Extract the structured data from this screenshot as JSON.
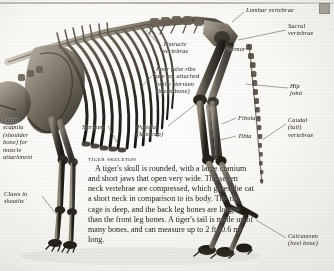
{
  "figure": {
    "title": "Tiger skeleton",
    "heading": "TIGER SKELETON",
    "body": "A tiger's skull is rounded, with a large cranium and short jaws that open very wide. The seven neck vertebrae are compressed, which gives the cat a short neck in comparison to its body. The rib cage is deep, and the back leg bones are longer than the front leg bones. A tiger's tail is made up of many bones, and can measure up to 2 ft (0.6 m) long."
  },
  "labels": [
    {
      "id": "lumbar-vertebrae",
      "text": "Lumbar vertebrae"
    },
    {
      "id": "sacral-vertebrae",
      "text": "Sacral\nvertebrae"
    },
    {
      "id": "hip-joint",
      "text": "Hip\njoint"
    },
    {
      "id": "caudal-vertebrae",
      "text": "Caudal\n(tail)\nvertebrae"
    },
    {
      "id": "thoracic-vertebrae",
      "text": "Thoracic\nvertebrae"
    },
    {
      "id": "femur",
      "text": "Femur"
    },
    {
      "id": "false-ribs",
      "text": "Four false ribs\nare not attached\nto the sternum\n(breastbone)"
    },
    {
      "id": "fibula",
      "text": "Fibula"
    },
    {
      "id": "tibia",
      "text": "Tibia"
    },
    {
      "id": "scapula",
      "text": "Large\nscapula\n(shoulder\nbone) for\nmuscle\nattachment"
    },
    {
      "id": "sternum",
      "text": "Sternum"
    },
    {
      "id": "patella",
      "text": "Patella\n(kneecap)"
    },
    {
      "id": "claws",
      "text": "Claws in\nsheaths"
    },
    {
      "id": "calcaneum",
      "text": "Calcaneum\n(heel bone)"
    }
  ],
  "colors": {
    "paper": "#f4f2ee",
    "ink": "#1d1a17",
    "bone_light": "#c9c2b6",
    "bone_mid": "#8d8579",
    "bone_dark": "#3d3932",
    "leader": "#6e6a63",
    "rule": "#a8a49c"
  }
}
